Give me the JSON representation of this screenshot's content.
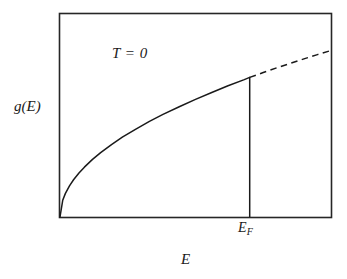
{
  "figure": {
    "labels": {
      "y_axis": "g(E)",
      "x_axis": "E",
      "annotation": "T = 0",
      "fermi_energy_base": "E",
      "fermi_energy_subscript": "F"
    },
    "colors": {
      "frame": "#262626",
      "curve": "#1a1a1a",
      "background": "#ffffff"
    }
  },
  "chart_data": {
    "type": "line",
    "title": "",
    "subtitle": "",
    "xlabel": "E",
    "ylabel": "g(E)",
    "annotations": [
      {
        "text": "T = 0",
        "x": 0.21,
        "y": 0.83
      },
      {
        "text": "E_F",
        "x": 0.7,
        "y": -0.06
      }
    ],
    "grid": false,
    "legend": null,
    "xlim": [
      0,
      1
    ],
    "ylim": [
      0,
      1
    ],
    "axis_ticks": {
      "x": [],
      "y": []
    },
    "series": [
      {
        "name": "g(E) occupied (solid)",
        "style": "solid",
        "x": [
          0.0,
          0.01,
          0.02,
          0.035,
          0.05,
          0.07,
          0.09,
          0.12,
          0.15,
          0.19,
          0.23,
          0.28,
          0.33,
          0.38,
          0.44,
          0.5,
          0.56,
          0.62,
          0.68,
          0.7
        ],
        "y": [
          0.0,
          0.082,
          0.116,
          0.153,
          0.183,
          0.216,
          0.245,
          0.283,
          0.316,
          0.356,
          0.392,
          0.432,
          0.47,
          0.504,
          0.542,
          0.578,
          0.612,
          0.645,
          0.675,
          0.686
        ]
      },
      {
        "name": "g(E) unoccupied (dashed)",
        "style": "dashed",
        "x": [
          0.7,
          0.75,
          0.8,
          0.85,
          0.9,
          0.95,
          1.0
        ],
        "y": [
          0.686,
          0.71,
          0.733,
          0.755,
          0.777,
          0.798,
          0.818
        ]
      },
      {
        "name": "Fermi level marker",
        "style": "vertical-line",
        "x": [
          0.7,
          0.7
        ],
        "y": [
          0.0,
          0.686
        ]
      }
    ]
  }
}
